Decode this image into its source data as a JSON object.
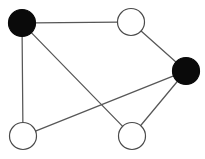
{
  "figure": {
    "width": 205,
    "height": 159,
    "background_color": "#ffffff",
    "title": "",
    "caption": ""
  },
  "chart_data": {
    "type": "diagram",
    "diagram_kind": "undirected-graph",
    "title": "",
    "xlabel": "",
    "ylabel": "",
    "legend": [],
    "node_count": 5,
    "edge_count": 6,
    "filled_node_count": 2,
    "hollow_node_count": 3,
    "node_radius": 13.5,
    "node_fill_filled": "#0a0a0a",
    "node_fill_hollow": "#ffffff",
    "node_stroke": "#4a4a4a",
    "edge_color": "#575757",
    "edge_width": 1.25,
    "nodes": [
      {
        "id": "n1",
        "label": "",
        "x": 22,
        "y": 23,
        "fill": "filled",
        "degree": 3
      },
      {
        "id": "n2",
        "label": "",
        "x": 131,
        "y": 22,
        "fill": "hollow",
        "degree": 2
      },
      {
        "id": "n3",
        "label": "",
        "x": 186,
        "y": 71,
        "fill": "filled",
        "degree": 3
      },
      {
        "id": "n4",
        "label": "",
        "x": 23,
        "y": 136,
        "fill": "hollow",
        "degree": 2
      },
      {
        "id": "n5",
        "label": "",
        "x": 132,
        "y": 136,
        "fill": "hollow",
        "degree": 2
      }
    ],
    "edges": [
      {
        "id": "e1",
        "source": "n1",
        "target": "n2",
        "label": ""
      },
      {
        "id": "e2",
        "source": "n2",
        "target": "n3",
        "label": ""
      },
      {
        "id": "e3",
        "source": "n1",
        "target": "n4",
        "label": ""
      },
      {
        "id": "e4",
        "source": "n1",
        "target": "n5",
        "label": ""
      },
      {
        "id": "e5",
        "source": "n4",
        "target": "n3",
        "label": ""
      },
      {
        "id": "e6",
        "source": "n5",
        "target": "n3",
        "label": ""
      }
    ]
  }
}
